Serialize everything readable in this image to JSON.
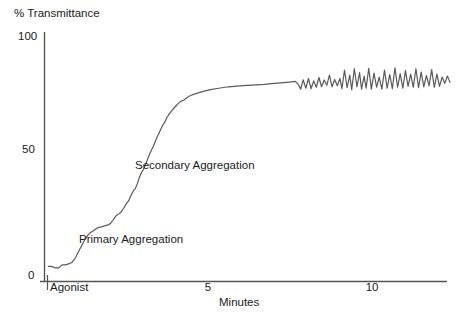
{
  "chart_data": {
    "type": "line",
    "title": "",
    "xlabel": "Minutes",
    "ylabel": "% Transmittance",
    "xlim": [
      0,
      11.2
    ],
    "ylim": [
      0,
      100
    ],
    "xticks": [
      5,
      10
    ],
    "xtick_labels": [
      "5",
      "10"
    ],
    "yticks": [
      0,
      50,
      100
    ],
    "ytick_labels": [
      "0",
      "50",
      "100"
    ],
    "grid": false,
    "legend": "none",
    "annotations": [
      {
        "text": "Agonist",
        "x": 0.2,
        "y": 0,
        "note": "tick mark on x-axis marking agonist addition"
      },
      {
        "text": "Primary Aggregation",
        "x": 1.35,
        "y": 17
      },
      {
        "text": "Secondary Aggregation",
        "x": 3.0,
        "y": 46
      }
    ],
    "series": [
      {
        "name": "Platelet aggregation trace",
        "points_xy": [
          [
            0.1,
            6.0
          ],
          [
            0.2,
            6.0
          ],
          [
            0.3,
            5.4
          ],
          [
            0.42,
            5.4
          ],
          [
            0.52,
            6.6
          ],
          [
            0.62,
            6.6
          ],
          [
            0.72,
            7.0
          ],
          [
            0.82,
            7.6
          ],
          [
            0.92,
            9.3
          ],
          [
            1.0,
            11.5
          ],
          [
            1.08,
            13.5
          ],
          [
            1.16,
            15.5
          ],
          [
            1.24,
            17.5
          ],
          [
            1.32,
            19.0
          ],
          [
            1.4,
            20.0
          ],
          [
            1.48,
            20.6
          ],
          [
            1.56,
            21.4
          ],
          [
            1.64,
            22.0
          ],
          [
            1.72,
            22.2
          ],
          [
            1.82,
            22.6
          ],
          [
            1.92,
            23.0
          ],
          [
            2.0,
            23.6
          ],
          [
            2.08,
            25.0
          ],
          [
            2.16,
            26.6
          ],
          [
            2.24,
            27.4
          ],
          [
            2.32,
            28.2
          ],
          [
            2.4,
            29.8
          ],
          [
            2.48,
            31.6
          ],
          [
            2.56,
            33.0
          ],
          [
            2.62,
            35.0
          ],
          [
            2.7,
            37.0
          ],
          [
            2.76,
            38.0
          ],
          [
            2.82,
            40.0
          ],
          [
            2.88,
            42.4
          ],
          [
            2.94,
            44.4
          ],
          [
            3.0,
            45.6
          ],
          [
            3.06,
            47.4
          ],
          [
            3.12,
            49.6
          ],
          [
            3.18,
            51.6
          ],
          [
            3.24,
            53.4
          ],
          [
            3.3,
            55.0
          ],
          [
            3.36,
            57.0
          ],
          [
            3.42,
            59.0
          ],
          [
            3.48,
            60.6
          ],
          [
            3.54,
            62.4
          ],
          [
            3.6,
            64.0
          ],
          [
            3.66,
            65.2
          ],
          [
            3.72,
            67.0
          ],
          [
            3.8,
            68.6
          ],
          [
            3.88,
            70.0
          ],
          [
            3.96,
            71.2
          ],
          [
            4.04,
            72.4
          ],
          [
            4.14,
            73.6
          ],
          [
            4.24,
            74.2
          ],
          [
            4.34,
            75.2
          ],
          [
            4.44,
            76.0
          ],
          [
            4.56,
            76.6
          ],
          [
            4.7,
            77.2
          ],
          [
            4.86,
            77.8
          ],
          [
            5.05,
            78.4
          ],
          [
            5.3,
            79.0
          ],
          [
            5.6,
            79.6
          ],
          [
            5.95,
            80.0
          ],
          [
            6.3,
            80.3
          ],
          [
            6.7,
            80.6
          ],
          [
            7.0,
            81.0
          ],
          [
            7.2,
            81.2
          ],
          [
            7.38,
            81.4
          ],
          [
            7.52,
            81.6
          ],
          [
            7.64,
            81.8
          ],
          [
            7.74,
            80.4
          ],
          [
            7.8,
            78.6
          ],
          [
            7.88,
            82.4
          ],
          [
            7.96,
            79.0
          ],
          [
            8.04,
            83.0
          ],
          [
            8.12,
            78.8
          ],
          [
            8.2,
            82.0
          ],
          [
            8.28,
            79.4
          ],
          [
            8.36,
            83.4
          ],
          [
            8.44,
            79.6
          ],
          [
            8.52,
            82.4
          ],
          [
            8.6,
            80.2
          ],
          [
            8.68,
            84.4
          ],
          [
            8.76,
            79.6
          ],
          [
            8.84,
            82.6
          ],
          [
            8.92,
            80.0
          ],
          [
            9.0,
            83.0
          ],
          [
            9.06,
            78.8
          ],
          [
            9.14,
            86.4
          ],
          [
            9.22,
            79.2
          ],
          [
            9.3,
            84.4
          ],
          [
            9.36,
            78.4
          ],
          [
            9.44,
            87.0
          ],
          [
            9.52,
            79.6
          ],
          [
            9.6,
            85.4
          ],
          [
            9.66,
            78.6
          ],
          [
            9.74,
            84.0
          ],
          [
            9.8,
            79.0
          ],
          [
            9.88,
            87.2
          ],
          [
            9.96,
            78.6
          ],
          [
            10.04,
            85.2
          ],
          [
            10.12,
            79.4
          ],
          [
            10.2,
            83.6
          ],
          [
            10.28,
            78.6
          ],
          [
            10.36,
            86.4
          ],
          [
            10.44,
            79.0
          ],
          [
            10.52,
            84.6
          ],
          [
            10.6,
            78.8
          ],
          [
            10.68,
            87.4
          ],
          [
            10.76,
            79.4
          ],
          [
            10.84,
            85.0
          ],
          [
            10.92,
            79.0
          ],
          [
            11.0,
            86.2
          ],
          [
            11.08,
            79.8
          ],
          [
            11.16,
            84.8
          ],
          [
            11.24,
            79.4
          ],
          [
            11.32,
            87.0
          ],
          [
            11.4,
            79.2
          ],
          [
            11.48,
            85.6
          ],
          [
            11.56,
            79.6
          ],
          [
            11.64,
            84.2
          ],
          [
            11.72,
            80.0
          ],
          [
            11.8,
            86.6
          ],
          [
            11.88,
            79.4
          ],
          [
            11.96,
            84.8
          ],
          [
            12.04,
            79.8
          ],
          [
            12.12,
            83.6
          ],
          [
            12.2,
            81.0
          ],
          [
            12.28,
            84.0
          ],
          [
            12.36,
            81.4
          ]
        ]
      }
    ],
    "colors": {
      "trace": "#5a5a5a",
      "axis": "#555555",
      "text": "#1a1a1a",
      "background": "#ffffff"
    }
  }
}
